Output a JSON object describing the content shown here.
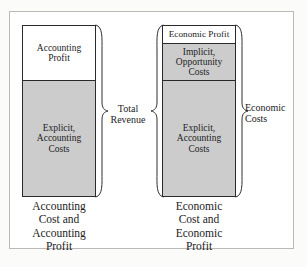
{
  "figure": {
    "colors": {
      "segment_fill_gray": "#cccccc",
      "segment_fill_white": "#ffffff",
      "outline": "#2a2a2a",
      "frame_border": "#b9b9b9",
      "text": "#1c1c1c"
    }
  },
  "left_bar": {
    "name": "Accounting view bar",
    "segments": [
      {
        "id": "accounting-profit",
        "fill": "white",
        "lines": [
          "Accounting",
          "Profit"
        ]
      },
      {
        "id": "explicit-accounting-costs",
        "fill": "gray",
        "lines": [
          "Explicit,",
          "Accounting",
          "Costs"
        ]
      }
    ],
    "caption": [
      "Accounting",
      "Cost and",
      "Accounting",
      "Profit"
    ]
  },
  "right_bar": {
    "name": "Economic view bar",
    "segments": [
      {
        "id": "economic-profit",
        "fill": "white",
        "lines": [
          "Economic Profit"
        ]
      },
      {
        "id": "implicit-opportunity-costs",
        "fill": "gray",
        "lines": [
          "Implicit,",
          "Opportunity",
          "Costs"
        ]
      },
      {
        "id": "explicit-accounting-costs",
        "fill": "gray",
        "lines": [
          "Explicit,",
          "Accounting",
          "Costs"
        ]
      }
    ],
    "caption": [
      "Economic",
      "Cost and",
      "Economic",
      "Profit"
    ]
  },
  "braces": {
    "total_revenue": {
      "lines": [
        "Total",
        "Revenue"
      ]
    },
    "economic_costs": {
      "lines": [
        "Economic",
        "Costs"
      ]
    }
  }
}
